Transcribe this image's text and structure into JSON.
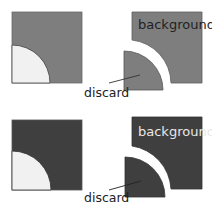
{
  "colors": {
    "background": "#ffffff",
    "gray_top": "#7e7e7e",
    "gray_bottom": "#3f3f3f",
    "light_fill": "#f1f1f1",
    "stroke": "#5a5a5a",
    "label_on_light": "#222222",
    "label_on_dark": "#e8e8e8"
  },
  "rows": [
    {
      "name": "top-row",
      "background_label": "background",
      "discard_label": "discard"
    },
    {
      "name": "bottom-row",
      "background_label": "background",
      "discard_label": "discard"
    }
  ]
}
